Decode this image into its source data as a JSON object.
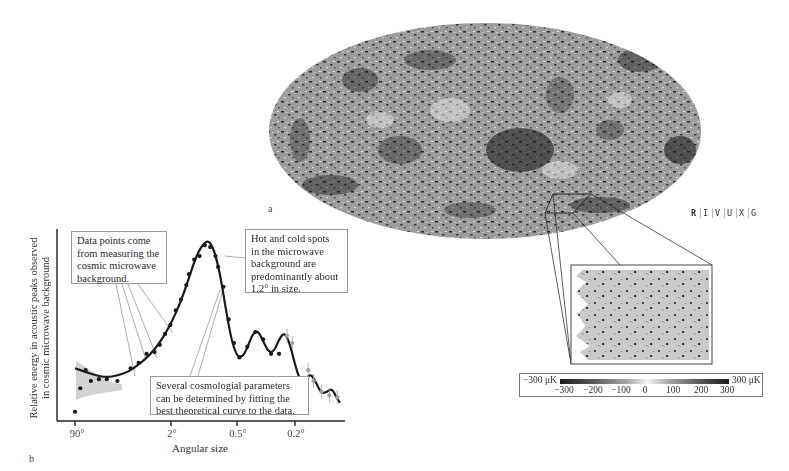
{
  "figure": {
    "panel_a_label": "a",
    "panel_b_label": "b",
    "wavelength_band": {
      "letters": [
        "R",
        "I",
        "V",
        "U",
        "X",
        "G"
      ],
      "highlighted": "R"
    },
    "map": {
      "description": "All-sky map of cosmic microwave background temperature fluctuations (Mollweide projection)",
      "colors": {
        "base": "#9a9a9a",
        "cold": "#1c1c1c",
        "hot": "#e0e0e0"
      }
    },
    "inset": {
      "description": "Zoomed patch of the microwave sky",
      "colors": {
        "base": "#c8c8c8",
        "spots": "#3a3a3a"
      }
    },
    "colorbar": {
      "min_label": "−300 μK",
      "max_label": "300 μK",
      "ticks": [
        "−300",
        "−200",
        "−100",
        "0",
        "100",
        "200",
        "300"
      ]
    }
  },
  "chart_data": {
    "type": "line",
    "title": "",
    "xlabel": "Angular size",
    "ylabel": "Relative energy in acoustic peaks observed in cosmic microwave background",
    "ylabel_lines": [
      "Relative energy in acoustic peaks observed",
      "in cosmic microwave background"
    ],
    "x_tick_labels": [
      "90°",
      "2°",
      "0.5°",
      "0.2°"
    ],
    "x_scale": "log (angular size decreasing to the right)",
    "grid": false,
    "legend": null,
    "series": [
      {
        "name": "Best theoretical curve",
        "kind": "line",
        "color": "#1a1a1a",
        "points": [
          [
            0.0,
            0.28
          ],
          [
            0.04,
            0.26
          ],
          [
            0.08,
            0.24
          ],
          [
            0.12,
            0.23
          ],
          [
            0.16,
            0.24
          ],
          [
            0.2,
            0.26
          ],
          [
            0.24,
            0.3
          ],
          [
            0.28,
            0.35
          ],
          [
            0.32,
            0.42
          ],
          [
            0.36,
            0.52
          ],
          [
            0.4,
            0.65
          ],
          [
            0.43,
            0.78
          ],
          [
            0.46,
            0.91
          ],
          [
            0.49,
            0.98
          ],
          [
            0.51,
            0.98
          ],
          [
            0.53,
            0.91
          ],
          [
            0.55,
            0.78
          ],
          [
            0.57,
            0.6
          ],
          [
            0.59,
            0.44
          ],
          [
            0.61,
            0.35
          ],
          [
            0.63,
            0.34
          ],
          [
            0.65,
            0.39
          ],
          [
            0.67,
            0.47
          ],
          [
            0.69,
            0.49
          ],
          [
            0.71,
            0.43
          ],
          [
            0.73,
            0.37
          ],
          [
            0.75,
            0.37
          ],
          [
            0.77,
            0.44
          ],
          [
            0.79,
            0.48
          ],
          [
            0.81,
            0.42
          ],
          [
            0.83,
            0.3
          ],
          [
            0.85,
            0.21
          ],
          [
            0.87,
            0.22
          ],
          [
            0.89,
            0.25
          ],
          [
            0.91,
            0.2
          ],
          [
            0.93,
            0.14
          ],
          [
            0.95,
            0.15
          ],
          [
            0.97,
            0.17
          ],
          [
            0.99,
            0.11
          ],
          [
            1.0,
            0.09
          ]
        ]
      },
      {
        "name": "Measured data points (black)",
        "kind": "scatter",
        "color": "#1a1a1a",
        "points": [
          [
            0.0,
            0.04
          ],
          [
            0.02,
            0.17
          ],
          [
            0.04,
            0.27
          ],
          [
            0.06,
            0.21
          ],
          [
            0.09,
            0.22
          ],
          [
            0.12,
            0.22
          ],
          [
            0.16,
            0.21
          ],
          [
            0.21,
            0.28
          ],
          [
            0.24,
            0.31
          ],
          [
            0.27,
            0.36
          ],
          [
            0.3,
            0.37
          ],
          [
            0.32,
            0.41
          ],
          [
            0.34,
            0.47
          ],
          [
            0.36,
            0.52
          ],
          [
            0.38,
            0.6
          ],
          [
            0.4,
            0.66
          ],
          [
            0.42,
            0.74
          ],
          [
            0.43,
            0.8
          ],
          [
            0.45,
            0.88
          ],
          [
            0.47,
            0.9
          ],
          [
            0.49,
            0.96
          ],
          [
            0.51,
            0.95
          ],
          [
            0.53,
            0.9
          ],
          [
            0.54,
            0.84
          ],
          [
            0.56,
            0.73
          ],
          [
            0.58,
            0.55
          ],
          [
            0.6,
            0.42
          ],
          [
            0.62,
            0.34
          ],
          [
            0.65,
            0.4
          ],
          [
            0.68,
            0.48
          ],
          [
            0.71,
            0.44
          ],
          [
            0.74,
            0.36
          ],
          [
            0.77,
            0.36
          ]
        ]
      },
      {
        "name": "Measured data points (gray, with error bars)",
        "kind": "scatter",
        "color": "#a0a0a0",
        "points": [
          [
            0.8,
            0.46
          ],
          [
            0.82,
            0.42
          ],
          [
            0.86,
            0.19
          ],
          [
            0.88,
            0.27
          ],
          [
            0.9,
            0.21
          ],
          [
            0.93,
            0.15
          ],
          [
            0.96,
            0.13
          ],
          [
            0.99,
            0.12
          ]
        ]
      }
    ],
    "annotations": [
      {
        "text": "Data points come from measuring the cosmic microwave background.",
        "lines": [
          "Data points come",
          "from measuring the",
          "cosmic microwave",
          "background."
        ]
      },
      {
        "text": "Hot and cold spots in the microwave background are predominantly about 1.2° in size.",
        "lines": [
          "Hot and cold spots",
          "in the microwave",
          "background are",
          "predominantly about",
          "1.2° in size."
        ]
      },
      {
        "text": "Several cosmologial parameters can be determined by fitting the best theoretical curve to the data.",
        "lines": [
          "Several cosmologial parameters",
          "can be determined by fitting the",
          "best theoretical curve to the data."
        ]
      }
    ],
    "uncertainty_band": "gray shaded cosmic-variance region at large angular sizes (left)"
  }
}
